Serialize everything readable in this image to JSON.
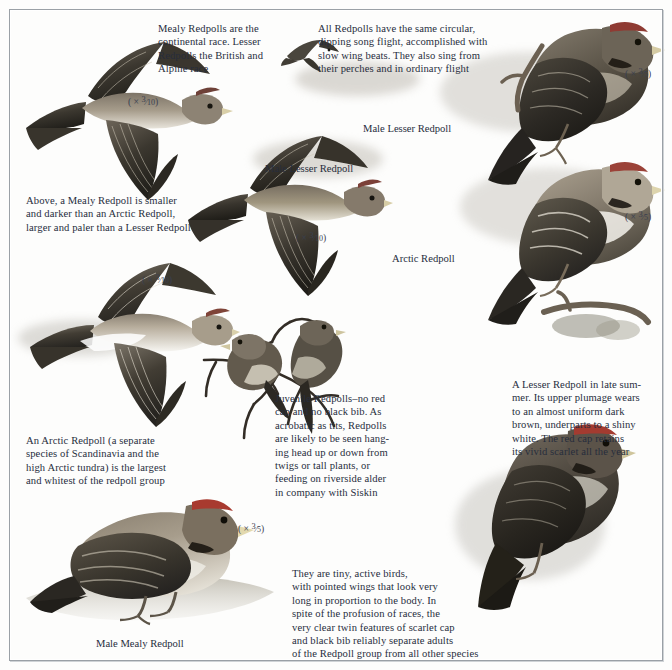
{
  "plate": {
    "title": "Redpolls",
    "background_color": "#fdfdfc",
    "frame_color": "#9aa0a6",
    "text_color": "#272d3c"
  },
  "captions": [
    {
      "name": "caption-mealy-vs-lesser-race",
      "text": "Mealy Redpolls are the\ncontinental race. Lesser\nRedpolls the British and\nAlpine race"
    },
    {
      "name": "caption-song-flight",
      "text": "All Redpolls have the same circular,\ndipping song flight, accomplished with\nslow wing beats. They also sing from\ntheir perches and in ordinary flight"
    },
    {
      "name": "caption-mealy-size-comparison",
      "text": "Above, a Mealy Redpoll is smaller\nand darker than an Arctic Redpoll,\nlarger and paler than a Lesser Redpoll"
    },
    {
      "name": "caption-arctic-redpoll-description",
      "text": "An Arctic Redpoll (a separate\nspecies of Scandinavia and the\nhigh Arctic tundra) is the largest\nand whitest of the redpoll group"
    },
    {
      "name": "caption-juvenile-redpolls",
      "text": "Juvenile Redpolls–no red\ncap and no black bib. As\nacrobatic as tits, Redpolls\nare likely to be seen hang-\ning head up or down from\ntwigs or tall plants, or\nfeeding on riverside alder\nin company with Siskin"
    },
    {
      "name": "caption-lesser-redpoll-late-summer",
      "text": "A Lesser Redpoll in late sum-\nmer. Its upper plumage wears\nto an almost uniform dark\nbrown, underparts to a shiny\nwhite. The red cap retains\nits vivid scarlet all the year"
    },
    {
      "name": "caption-tiny-active-birds",
      "text": "They are tiny, active birds,\nwith pointed wings that look very\nlong in proportion to the body. In\nspite of the profusion of races, the\nvery clear twin features of scarlet cap\nand black bib reliably separate adults\nof the Redpoll group from all other species"
    }
  ],
  "labels": [
    {
      "name": "label-male-lesser-redpoll-perched",
      "text": "Male Lesser Redpoll"
    },
    {
      "name": "label-male-lesser-redpoll-flight",
      "text": "Male Lesser Redpoll"
    },
    {
      "name": "label-arctic-redpoll",
      "text": "Arctic Redpoll"
    },
    {
      "name": "label-male-mealy-redpoll",
      "text": "Male Mealy Redpoll"
    }
  ],
  "scales": [
    {
      "name": "scale-mealy-redpoll-flight",
      "prefix": "( ×",
      "numerator": "3",
      "denominator": "10",
      "suffix": ")"
    },
    {
      "name": "scale-lesser-redpoll-flight",
      "prefix": "( ×",
      "numerator": "3",
      "denominator": "10",
      "suffix": ")"
    },
    {
      "name": "scale-arctic-redpoll-flight",
      "prefix": "( ×",
      "numerator": "3",
      "denominator": "10",
      "suffix": ")"
    },
    {
      "name": "scale-male-lesser-redpoll-perched",
      "prefix": "( ×",
      "numerator": "3",
      "denominator": "5",
      "suffix": ")"
    },
    {
      "name": "scale-arctic-redpoll-perched",
      "prefix": "( ×",
      "numerator": "3",
      "denominator": "5",
      "suffix": ")"
    },
    {
      "name": "scale-male-mealy-redpoll",
      "prefix": "( ×",
      "numerator": "3",
      "denominator": "5",
      "suffix": ")"
    }
  ],
  "illustrations": [
    {
      "name": "illustration-mealy-redpoll-in-flight"
    },
    {
      "name": "illustration-lesser-redpoll-in-flight"
    },
    {
      "name": "illustration-arctic-redpoll-in-flight"
    },
    {
      "name": "illustration-redpoll-song-flight-silhouette"
    },
    {
      "name": "illustration-male-lesser-redpoll-perched"
    },
    {
      "name": "illustration-arctic-redpoll-perched"
    },
    {
      "name": "illustration-juvenile-redpolls-on-twigs"
    },
    {
      "name": "illustration-lesser-redpoll-late-summer"
    },
    {
      "name": "illustration-male-mealy-redpoll-on-ground"
    }
  ]
}
